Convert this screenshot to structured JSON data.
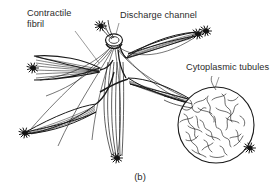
{
  "figure": {
    "caption": "(b)",
    "background_color": "#ffffff",
    "ink_color": "#1a1a1a",
    "text_color": "#2b2b2b",
    "width": 280,
    "height": 193
  },
  "labels": {
    "contractile_fibril": "Contractile\nfibril",
    "discharge_channel": "Discharge channel",
    "cytoplasmic_tubules": "Cytoplasmic tubules"
  },
  "diagram": {
    "type": "biological-line-drawing",
    "parts": [
      {
        "name": "discharge-channel-ring",
        "description": "small oval ring at apex where fibril bundles converge",
        "cx": 114,
        "cy": 40,
        "rx": 8,
        "ry": 6
      },
      {
        "name": "contractile-fibril-lobe-left",
        "description": "striated spindle lobe pointing left with dark tuft terminus",
        "angle_deg": 186
      },
      {
        "name": "contractile-fibril-lobe-lower-left",
        "description": "striated spindle lobe pointing down-left with dark tuft terminus",
        "angle_deg": 212
      },
      {
        "name": "contractile-fibril-lobe-lower-center",
        "description": "fibril bundle descending to a dark tuft terminus",
        "angle_deg": 268
      },
      {
        "name": "contractile-fibril-lobe-upper-right",
        "description": "striated spindle lobe pointing up-right with dark tuft terminus",
        "angle_deg": 26
      },
      {
        "name": "contractile-fibril-lobe-right",
        "description": "striated spindle lobe pointing right toward inset circle",
        "angle_deg": 352
      },
      {
        "name": "cytoplasmic-tubules-inset",
        "description": "large circle filled with squiggly tubule network, dark tuft at lower-right edge",
        "cx": 216,
        "cy": 125,
        "r": 38
      }
    ],
    "leader_lines": [
      {
        "name": "leader-contractile-fibril",
        "from": [
          74,
          30
        ],
        "to": [
          98,
          62
        ]
      },
      {
        "name": "leader-discharge-channel",
        "from": [
          118,
          22
        ],
        "to": [
          112,
          46
        ]
      },
      {
        "name": "leader-cytoplasmic-tubules",
        "from": [
          218,
          76
        ],
        "to": [
          214,
          90
        ]
      }
    ]
  }
}
